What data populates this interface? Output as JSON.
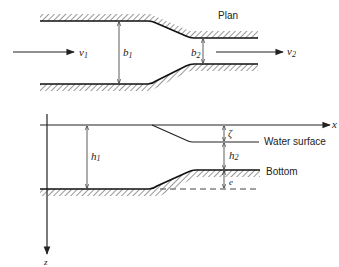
{
  "diagram": {
    "plan_view": {
      "label": "Plan",
      "inflow_velocity": {
        "symbol": "v",
        "subscript": "1"
      },
      "outflow_velocity": {
        "symbol": "v",
        "subscript": "2"
      },
      "width_upstream": {
        "symbol": "b",
        "subscript": "1"
      },
      "width_downstream": {
        "symbol": "b",
        "subscript": "2"
      }
    },
    "section_view": {
      "x_axis_label": "x",
      "z_axis_label": "z",
      "depth_upstream": {
        "symbol": "h",
        "subscript": "1"
      },
      "depth_downstream": {
        "symbol": "h",
        "subscript": "2"
      },
      "surface_drop": {
        "symbol": "ζ"
      },
      "bottom_rise": {
        "symbol": "e"
      },
      "water_surface_label": "Water surface",
      "bottom_label": "Bottom"
    },
    "colors": {
      "ink": "#222222",
      "background": "#ffffff"
    }
  }
}
